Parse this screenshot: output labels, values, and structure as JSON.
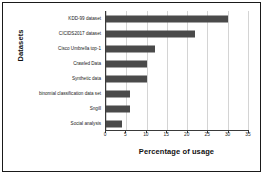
{
  "chart_data": {
    "type": "bar",
    "orientation": "horizontal",
    "title": "",
    "xlabel": "Percentage of usage",
    "ylabel": "Datasets",
    "categories": [
      "Social analysis",
      "Sngill",
      "binomial classification data set",
      "Synthetic data",
      "Crawled Data",
      "Cisco Umbrella top-1",
      "CICIDS2017 dataset",
      "KDD-99 dataset"
    ],
    "values": [
      4,
      6,
      6,
      10,
      10,
      12,
      22,
      30
    ],
    "xlim": [
      0,
      35
    ],
    "xticks": [
      0,
      5,
      10,
      15,
      20,
      25,
      30,
      35
    ],
    "xtick_labels": [
      "0",
      "5",
      "10",
      "15",
      "20",
      "25",
      "30",
      "35"
    ],
    "grid": "vertical",
    "legend": "none",
    "bar_color": "#4a4a4a",
    "axis_color": "#3a3a3a",
    "gridline_color": "#d4d4d4",
    "border_color": "#1a1a1a",
    "background_color": "#ffffff"
  }
}
